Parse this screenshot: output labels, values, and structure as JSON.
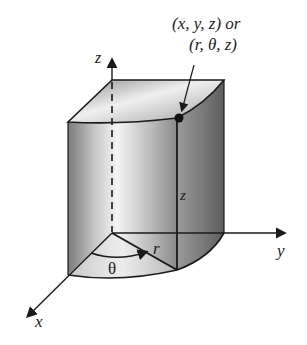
{
  "figure": {
    "type": "cylindrical-coordinates-diagram",
    "point_label_line1": "(x, y, z) or",
    "point_label_line2": "(r, θ, z)",
    "axes": {
      "x_label": "x",
      "y_label": "y",
      "z_label": "z"
    },
    "annotations": {
      "radius_label": "r",
      "angle_label": "θ",
      "height_label": "z"
    },
    "colors": {
      "stroke": "#1a1a1a",
      "shade_dark": "#6b6b6b",
      "shade_light": "#f2f2f2",
      "background": "#ffffff"
    }
  }
}
